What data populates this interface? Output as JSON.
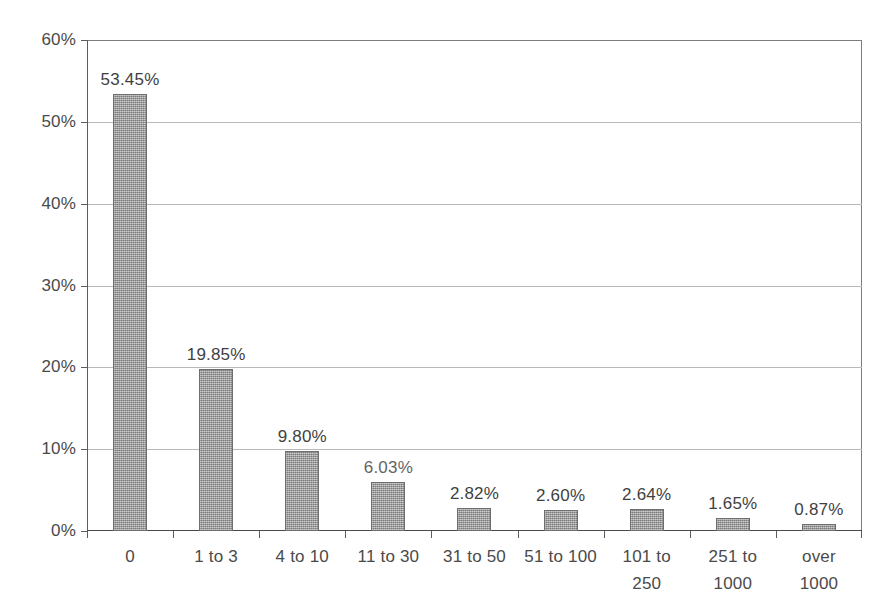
{
  "chart_data": {
    "type": "bar",
    "title": "",
    "subtitle": "",
    "xlabel": "",
    "ylabel": "",
    "categories": [
      "0",
      "1 to 3",
      "4 to 10",
      "11 to 30",
      "31 to 50",
      "51 to 100",
      "101 to\n250",
      "251 to\n1000",
      "over\n1000"
    ],
    "values": [
      53.45,
      19.85,
      9.8,
      6.03,
      2.82,
      2.6,
      2.64,
      1.65,
      0.87
    ],
    "data_labels": [
      "53.45%",
      "19.85%",
      "9.80%",
      "6.03%",
      "2.82%",
      "2.60%",
      "2.64%",
      "1.65%",
      "0.87%"
    ],
    "ylim": [
      0,
      60
    ],
    "ytick_labels": [
      "0%",
      "10%",
      "20%",
      "30%",
      "40%",
      "50%",
      "60%"
    ],
    "ytick_values": [
      0,
      10,
      20,
      30,
      40,
      50,
      60
    ],
    "grid": true,
    "legend": null,
    "legend_position": "none",
    "bar_color": "#9d9d9d",
    "bar_edge_color": "#6e6e6e",
    "grid_color": "#b9b9b9",
    "axis_color": "#4a4a4a",
    "background_color": "#ffffff"
  },
  "categories_display": [
    {
      "line1": "0",
      "line2": ""
    },
    {
      "line1": "1 to 3",
      "line2": ""
    },
    {
      "line1": "4 to 10",
      "line2": ""
    },
    {
      "line1": "11 to 30",
      "line2": ""
    },
    {
      "line1": "31 to 50",
      "line2": ""
    },
    {
      "line1": "51 to 100",
      "line2": ""
    },
    {
      "line1": "101 to",
      "line2": "250"
    },
    {
      "line1": "251 to",
      "line2": "1000"
    },
    {
      "line1": "over",
      "line2": "1000"
    }
  ]
}
